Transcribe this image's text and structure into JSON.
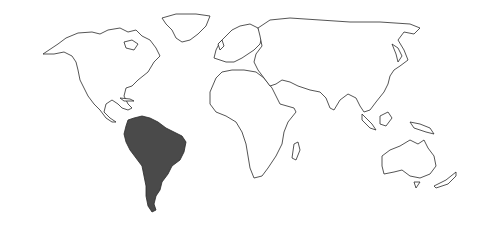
{
  "map": {
    "type": "world-outline",
    "highlighted_region": "South America",
    "colors": {
      "background": "#ffffff",
      "land_fill": "#ffffff",
      "outline": "#2a2a2a",
      "highlight_fill": "#4a4a4a"
    },
    "regions": [
      "North America",
      "Greenland",
      "South America",
      "Europe",
      "Africa",
      "Asia",
      "Australia",
      "New Zealand",
      "Madagascar",
      "Japan",
      "Indonesia",
      "New Guinea"
    ]
  }
}
